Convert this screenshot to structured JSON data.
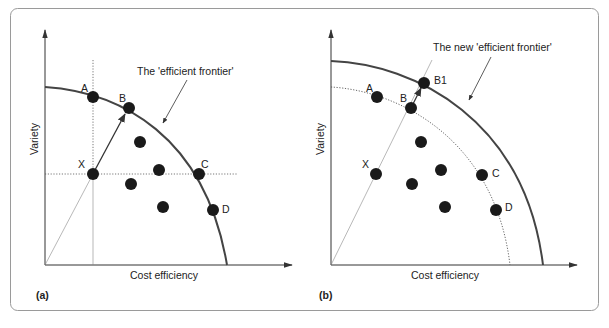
{
  "figure": {
    "panels": [
      {
        "id": "a",
        "panel_label": "(a)",
        "x_axis_label": "Cost efficiency",
        "y_axis_label": "Variety",
        "frontier_label": "The 'efficient frontier'",
        "points": {
          "A": "A",
          "B": "B",
          "X": "X",
          "C": "C",
          "D": "D"
        }
      },
      {
        "id": "b",
        "panel_label": "(b)",
        "x_axis_label": "Cost efficiency",
        "y_axis_label": "Variety",
        "frontier_label": "The new 'efficient frontier'",
        "points": {
          "A": "A",
          "B": "B",
          "B1": "B1",
          "X": "X",
          "C": "C",
          "D": "D"
        }
      }
    ],
    "colors": {
      "frame": "#9a9a9a",
      "frontier": "#444444",
      "dot": "#1a1a1a",
      "guide": "#555555"
    },
    "caption": "(cropped — not legible)"
  }
}
